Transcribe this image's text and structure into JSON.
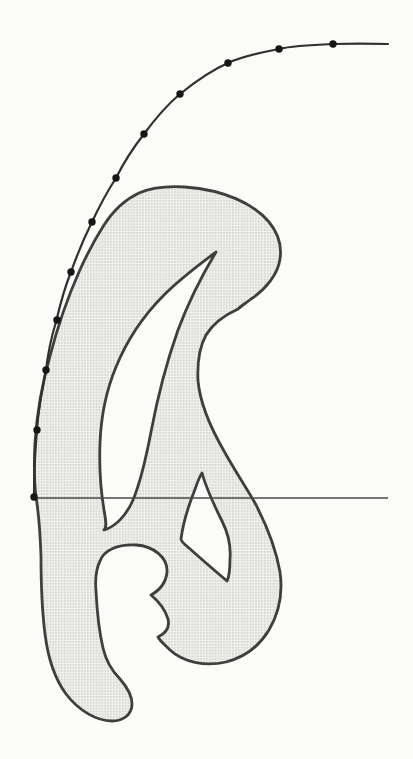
{
  "figure": {
    "kind": "french-curve-fitting-diagram",
    "canvas": {
      "width": 413,
      "height": 759
    },
    "colors": {
      "page_background": "#fbfbf9",
      "template_outline": "#3e3e3e",
      "template_fill_base": "#f3f2ef",
      "template_stipple_dot": "#9f9f9f",
      "fitted_curve": "#303030",
      "data_point": "#161616",
      "baseline": "#4a4a4a"
    },
    "stroke_widths": {
      "template_outline": 2.8,
      "fitted_curve": 2.2,
      "baseline": 1.3
    },
    "point_radius": 3.7,
    "data_points": [
      [
        333,
        44
      ],
      [
        279,
        49
      ],
      [
        228,
        63
      ],
      [
        180,
        94
      ],
      [
        144,
        134
      ],
      [
        116,
        178
      ],
      [
        92,
        222
      ],
      [
        71,
        272
      ],
      [
        57,
        320
      ],
      [
        46,
        370
      ],
      [
        37,
        430
      ],
      [
        34,
        497
      ]
    ],
    "fitted_curve_path": "M 388,44 C 370,43.5 350,43.5 333,44 C 307,45 291,46 279,49 C 258,53 241,57 228,63 C 212,70 196,81 180,94 C 167,105 155,119 144,134 C 133,148 124,162 116,178 C 107,192 99,207 92,222 C 84,238 77,255 71,272 C 64,289 60,305 56,322 C 51,338 48,353 46,370 C 42,390 38,410 37,430 C 35,452 34,475 34,498",
    "template_path": "M 185,187 C 225,190 254,204 269,222 C 278,233 282,246 280,259 C 278,274 266,289 251,299 C 246,303 241,306 238,309 C 227,314 214,322 206,335 C 200,346 197,361 198,381 C 200,402 209,425 224,451 C 235,471 246,487 255,503 C 266,524 276,549 280,572 C 283,593 279,613 269,630 C 258,648 242,658 226,662 C 205,667 183,662 170,650 C 165,645 160,641 158,637 C 166,633 170,627 168,619 C 165,609 157,600 151,595 C 160,590 166,583 167,572 C 168,558 154,546 136,545 C 118,544 104,550 100,561 C 96,569 95,579 96,591 C 97,611 99,631 103,648 C 106,661 112,671 120,679 C 127,687 132,695 132,704 C 132,714 124,721 112,721 C 97,721 79,711 66,694 C 55,679 48,658 45,634 C 42,610 41,583 41,556 C 40,529 38,509 36,497 C 34,480 34,461 35,442 C 37,414 42,384 50,356 C 57,329 67,299 79,272 C 87,254 95,239 104,225 C 113,211 124,200 139,193 C 153,187 168,186 185,187 Z M 216,252 C 200,264 181,278 164,295 C 144,315 127,340 116,367 C 106,391 101,417 100,443 C 99,468 101,492 104,510 C 106,521 107,528 104,530 C 115,527 126,516 133,500 C 141,481 146,458 151,432 C 157,400 166,364 178,330 C 190,298 204,272 216,252 Z M 202,473 C 207,491 215,507 222,521 C 228,533 231,547 230,559 C 230,569 229,577 227,581 C 214,570 199,557 189,548 C 184,544 181,541 181,539 C 183,524 188,507 194,492 C 197,484 199,477 202,473 Z",
    "baseline": {
      "x1": 34,
      "y1": 498,
      "x2": 388,
      "y2": 498
    }
  }
}
